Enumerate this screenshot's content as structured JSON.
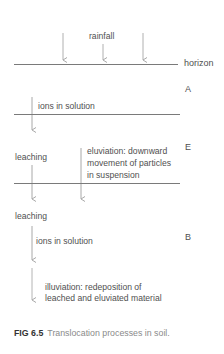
{
  "figure": {
    "labels": {
      "rainfall": "rainfall",
      "horizon": "horizon",
      "ions_in_solution_a": "ions in solution",
      "leaching_e": "leaching",
      "eluviation_line1": "eluviation: downward",
      "eluviation_line2": "movement of particles",
      "eluviation_line3": "in suspension",
      "leaching_b": "leaching",
      "ions_in_solution_b": "ions in solution",
      "illuviation_line1": "illuviation: redeposition of",
      "illuviation_line2": "leached and eluviated material"
    },
    "horizons": {
      "a": "A",
      "e": "E",
      "b": "B"
    },
    "caption": {
      "number": "FIG 6.5",
      "text": "Translocation processes in soil."
    },
    "colors": {
      "line": "#7a7a7a",
      "arrow": "#a0a0a0",
      "text": "#505050"
    }
  }
}
